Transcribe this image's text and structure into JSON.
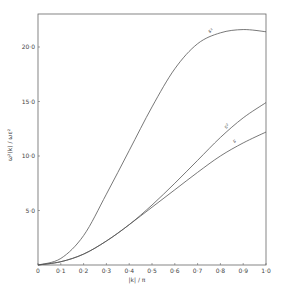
{
  "chart_data": {
    "type": "line",
    "title": "",
    "xlabel": "|k| / π",
    "ylabel": "ω²(k) / ωε²",
    "xlim": [
      0,
      1.0
    ],
    "ylim": [
      0,
      23
    ],
    "grid": false,
    "legend": "inline curve labels",
    "x_ticks": [
      "0",
      "0·1",
      "0·2",
      "0·3",
      "0·4",
      "0·5",
      "0·6",
      "0·7",
      "0·8",
      "0·9",
      "1·0"
    ],
    "y_ticks": [
      "5·0",
      "10·0",
      "15·0",
      "20·0"
    ],
    "x": [
      0,
      0.1,
      0.2,
      0.3,
      0.4,
      0.5,
      0.6,
      0.7,
      0.8,
      0.9,
      1.0
    ],
    "series": [
      {
        "name": "s¹",
        "values": [
          0,
          0.6,
          2.7,
          6.5,
          10.5,
          14.5,
          18.0,
          20.3,
          21.3,
          21.6,
          21.4
        ]
      },
      {
        "name": "s²",
        "values": [
          0,
          0.3,
          1.0,
          2.2,
          3.7,
          5.5,
          7.5,
          9.6,
          11.7,
          13.5,
          14.9
        ]
      },
      {
        "name": "s",
        "values": [
          0,
          0.3,
          1.0,
          2.2,
          3.7,
          5.3,
          6.9,
          8.5,
          10.0,
          11.2,
          12.2
        ]
      }
    ]
  },
  "labels": {
    "xlabel": "|k| / π",
    "ylabel": "ω²(k) / ωε²",
    "origin": "0",
    "curve_s1": "s¹",
    "curve_s2": "s²",
    "curve_s": "s"
  }
}
